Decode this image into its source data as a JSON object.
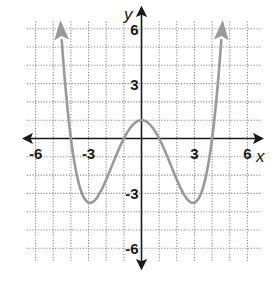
{
  "chart_data": {
    "type": "line",
    "title": "",
    "xlabel": "x",
    "ylabel": "y",
    "xlim": [
      -6.5,
      6.5
    ],
    "ylim": [
      -6.5,
      6.5
    ],
    "grid": true,
    "grid_step": 1,
    "x_ticks": [
      -6,
      -3,
      3,
      6
    ],
    "y_ticks": [
      6,
      3,
      -3,
      -6
    ],
    "x_tick_labels": [
      "-6",
      "-3",
      "3",
      "6"
    ],
    "y_tick_labels": [
      "6",
      "3",
      "-3",
      "-6"
    ],
    "series": [
      {
        "name": "f(x)",
        "function": "(x^2 - 1)(x^2 - 16) / 16",
        "key_points": [
          {
            "x": -4,
            "y": 0
          },
          {
            "x": -3,
            "y": -3.5
          },
          {
            "x": -1,
            "y": 0
          },
          {
            "x": 0,
            "y": 1
          },
          {
            "x": 1,
            "y": 0
          },
          {
            "x": 3,
            "y": -3.5
          },
          {
            "x": 4,
            "y": 0
          }
        ],
        "end_behavior": "arrows upward on both ends (x ≈ ±4.55, y ≈ 7.3)",
        "color": "#9a9a9a"
      }
    ],
    "colors": {
      "axis": "#1a1a1a",
      "grid": "#8a8a8a",
      "curve": "#9a9a9a"
    }
  }
}
